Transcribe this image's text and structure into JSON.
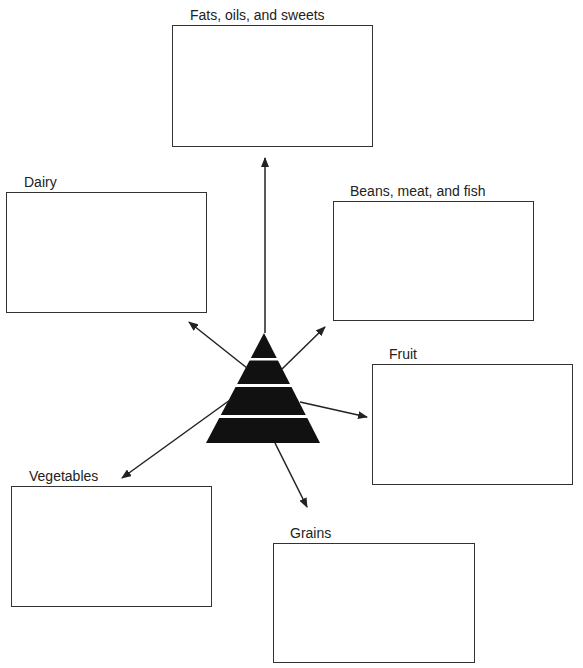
{
  "diagram": {
    "type": "food-pyramid-graphic-organizer",
    "center": "food-pyramid",
    "categories": [
      {
        "id": "fats",
        "label": "Fats, oils, and sweets"
      },
      {
        "id": "dairy",
        "label": "Dairy"
      },
      {
        "id": "beans",
        "label": "Beans, meat, and fish"
      },
      {
        "id": "fruit",
        "label": "Fruit"
      },
      {
        "id": "vegetables",
        "label": "Vegetables"
      },
      {
        "id": "grains",
        "label": "Grains"
      }
    ],
    "colors": {
      "stroke": "#333333",
      "pyramid": "#111111",
      "text": "#222222"
    }
  }
}
